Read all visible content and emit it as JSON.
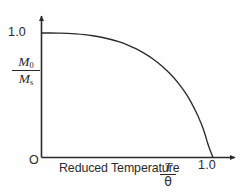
{
  "figure": {
    "background_color": "#fefefe",
    "ink_color": "#2a2a2a"
  },
  "axes": {
    "origin_label": "O",
    "y_tick_label": "1.0",
    "x_tick_label": "1.0",
    "x_title": "Reduced Temperature",
    "x_ratio_numerator": "T",
    "x_ratio_denominator": "θ",
    "y_ratio_numerator": "M",
    "y_ratio_numerator_sub": "0",
    "y_ratio_denominator": "M",
    "y_ratio_denominator_sub": "s"
  },
  "chart_data": {
    "type": "line",
    "title": "",
    "xlabel": "Reduced Temperature T/θ",
    "ylabel": "M0/Ms",
    "xlim": [
      0,
      1.18
    ],
    "ylim": [
      0,
      1.12
    ],
    "grid": false,
    "legend": false,
    "x_ticks": [
      1.0
    ],
    "x_tick_labels": [
      "1.0"
    ],
    "y_ticks": [
      1.0
    ],
    "y_tick_labels": [
      "1.0"
    ],
    "annotations": [
      "O"
    ],
    "series": [
      {
        "name": "Spontaneous magnetization (Brillouin-type)",
        "x": [
          0.0,
          0.05,
          0.1,
          0.15,
          0.2,
          0.25,
          0.3,
          0.35,
          0.4,
          0.45,
          0.5,
          0.55,
          0.6,
          0.65,
          0.7,
          0.75,
          0.8,
          0.85,
          0.9,
          0.93,
          0.95,
          0.97,
          0.98,
          0.99,
          1.0
        ],
        "y": [
          1.0,
          1.0,
          0.999,
          0.997,
          0.993,
          0.987,
          0.978,
          0.966,
          0.95,
          0.93,
          0.905,
          0.874,
          0.836,
          0.791,
          0.737,
          0.672,
          0.594,
          0.497,
          0.37,
          0.277,
          0.201,
          0.11,
          0.07,
          0.035,
          0.0
        ]
      }
    ]
  }
}
